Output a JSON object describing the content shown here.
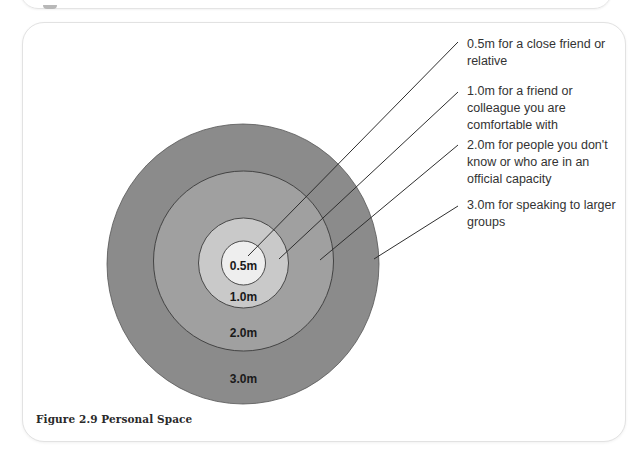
{
  "figure": {
    "caption": "Figure 2.9 Personal Space",
    "zones": [
      {
        "label": "0.5m",
        "description": "0.5m for a close friend or relative",
        "color": "#eeeeee"
      },
      {
        "label": "1.0m",
        "description": "1.0m for a friend or colleague you are comfortable with",
        "color": "#c9c9c9"
      },
      {
        "label": "2.0m",
        "description": "2.0m for people you don't know or who are in an official capacity",
        "color": "#a0a0a0"
      },
      {
        "label": "3.0m",
        "description": "3.0m for speaking to larger groups",
        "color": "#8b8b8b"
      }
    ],
    "stroke_color": "#3a3a3a"
  }
}
